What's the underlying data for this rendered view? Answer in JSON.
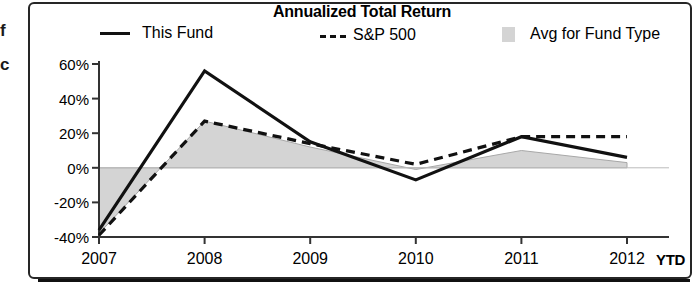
{
  "page": {
    "edge_text_lines": [
      "f",
      "c"
    ]
  },
  "figure": {
    "title": "Annualized Total Return",
    "legend": [
      {
        "key": "this_fund",
        "label": "This Fund",
        "marker": "solid-line-swatch"
      },
      {
        "key": "sp500",
        "label": "S&P 500",
        "marker": "dashed-line-swatch"
      },
      {
        "key": "avg_fund_type",
        "label": "Avg for Fund Type",
        "marker": "gray-area-swatch"
      }
    ],
    "x_axis_unit_label": "YTD"
  },
  "colors": {
    "line_this_fund": "#111111",
    "line_sp500": "#111111",
    "area_avg_fund_type": "#d4d4d4",
    "area_avg_fund_type_edge": "#a8a8a8",
    "axis": "#333333",
    "frame": "#262626",
    "zero_line": "#bbbbbb"
  },
  "chart_data": {
    "type": "line",
    "title": "Annualized Total Return",
    "xlabel": "",
    "ylabel": "",
    "categories": [
      "2007",
      "2008",
      "2009",
      "2010",
      "2011",
      "2012"
    ],
    "x_tick_labels": [
      "2007",
      "2008",
      "2009",
      "2010",
      "2011",
      "2012"
    ],
    "y_tick_labels": [
      "60%",
      "40%",
      "20%",
      "0%",
      "-20%",
      "-40%"
    ],
    "y_tick_values": [
      60,
      40,
      20,
      0,
      -20,
      -40
    ],
    "ylim": [
      -40,
      60
    ],
    "grid": false,
    "legend_position": "top",
    "series": [
      {
        "name": "This Fund",
        "style": "solid",
        "values": [
          -36,
          56,
          15,
          -7,
          18,
          6
        ]
      },
      {
        "name": "S&P 500",
        "style": "dashed",
        "values": [
          -39,
          27,
          14,
          2,
          18,
          18
        ]
      },
      {
        "name": "Avg for Fund Type",
        "style": "filled-area",
        "values": [
          -38,
          27,
          12,
          -1,
          10,
          3
        ]
      }
    ]
  }
}
